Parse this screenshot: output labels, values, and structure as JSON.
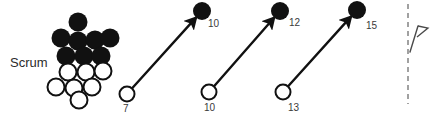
{
  "diagram": {
    "type": "rugby-play-diagram",
    "width": 436,
    "height": 114,
    "background_color": "#ffffff"
  },
  "scrum": {
    "label": "Scrum",
    "label_x": 10,
    "label_y": 67,
    "filled_color": "#111111",
    "open_color": "#ffffff",
    "outline_color": "#111111",
    "radius": 9.5,
    "filled_players": [
      {
        "cx": 78,
        "cy": 22
      },
      {
        "cx": 61,
        "cy": 38
      },
      {
        "cx": 78,
        "cy": 41
      },
      {
        "cx": 95,
        "cy": 40
      },
      {
        "cx": 110,
        "cy": 38
      },
      {
        "cx": 66,
        "cy": 56
      },
      {
        "cx": 84,
        "cy": 56
      },
      {
        "cx": 101,
        "cy": 56
      }
    ],
    "open_players": [
      {
        "cx": 68,
        "cy": 72
      },
      {
        "cx": 86,
        "cy": 72
      },
      {
        "cx": 103,
        "cy": 71
      },
      {
        "cx": 56,
        "cy": 87
      },
      {
        "cx": 74,
        "cy": 88
      },
      {
        "cx": 92,
        "cy": 87
      },
      {
        "cx": 79,
        "cy": 100
      }
    ]
  },
  "runs": [
    {
      "from_label": "7",
      "to_label": "10",
      "from_x": 127,
      "from_y": 94,
      "to_x": 202,
      "to_y": 11,
      "from_num_x": 123,
      "from_num_y": 112,
      "to_num_x": 208,
      "to_num_y": 27
    },
    {
      "from_label": "10",
      "to_label": "12",
      "from_x": 209,
      "from_y": 92,
      "to_x": 280,
      "to_y": 11,
      "from_num_x": 204,
      "from_num_y": 111,
      "to_num_x": 289,
      "to_num_y": 26
    },
    {
      "from_label": "13",
      "to_label": "15",
      "from_x": 283,
      "from_y": 92,
      "to_x": 357,
      "to_y": 10,
      "from_num_x": 288,
      "from_num_y": 111,
      "to_num_x": 366,
      "to_num_y": 29
    }
  ],
  "touchline": {
    "x": 408,
    "y_top": 4,
    "y_bottom": 104,
    "color": "#8a8a8a"
  },
  "corner_flag": {
    "stem_x1": 410,
    "stem_y1": 52,
    "stem_x2": 418,
    "stem_y2": 26,
    "head_points": "418,26 428,28 417,37",
    "color": "#4a4a4a"
  }
}
